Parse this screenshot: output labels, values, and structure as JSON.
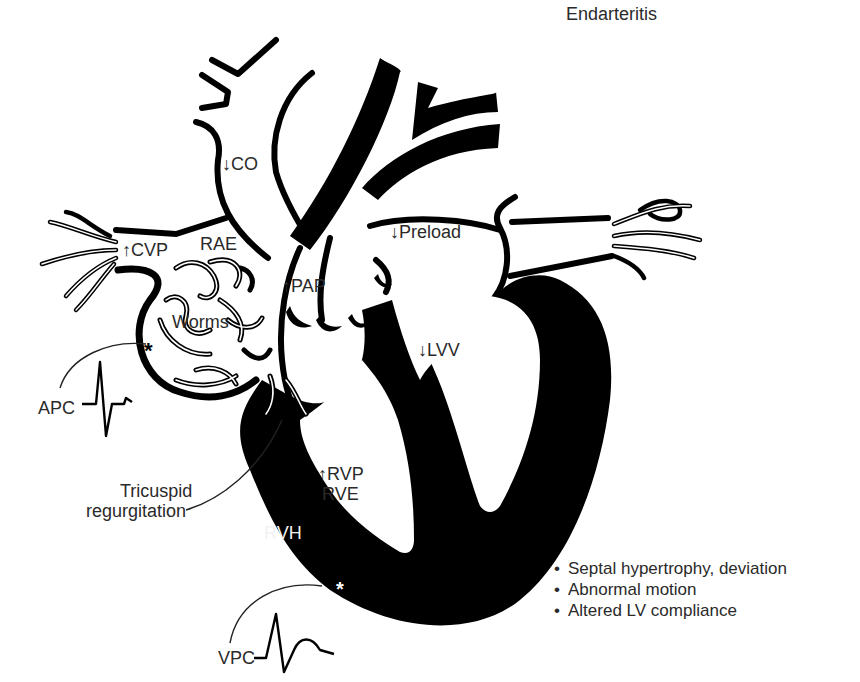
{
  "figure": {
    "type": "cardiac-anatomy-diagram",
    "colors": {
      "ink": "#000000",
      "text": "#2a2a2a",
      "inverse_text": "#f2f2f2",
      "background": "#ffffff"
    }
  },
  "labels": {
    "endarteritis": "Endarteritis",
    "co": "↓CO",
    "cvp": "↑CVP",
    "rae": "RAE",
    "preload": "↓Preload",
    "pap": "↑PAP",
    "worms": "Worms",
    "lvv": "↓LVV",
    "apc": "APC",
    "tricuspid_line1": "Tricuspid",
    "tricuspid_line2": "regurgitation",
    "rvp": "↑RVP",
    "rve": "RVE",
    "rvh": "RVH",
    "vpc": "VPC",
    "apc_marker": "*",
    "vpc_marker": "*"
  },
  "septal_notes": [
    "Septal hypertrophy, deviation",
    "Abnormal motion",
    "Altered LV compliance"
  ]
}
